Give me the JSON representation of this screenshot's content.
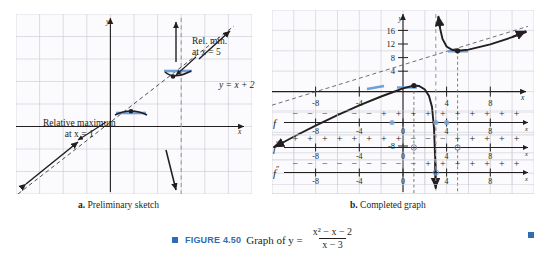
{
  "figure": {
    "label": "FIGURE 4.50",
    "text_before": "Graph of y =",
    "numerator": "x² − x − 2",
    "denominator": "x − 3",
    "accent_color": "#2e6db4"
  },
  "panel_a": {
    "caption_letter": "a.",
    "caption_text": "Preliminary sketch",
    "axis_x_label": "x",
    "axis_y_label": "y",
    "annotations": [
      {
        "name": "relative-maximum",
        "line1": "Relative maximum",
        "line2": "at x = 1"
      },
      {
        "name": "relative-minimum",
        "line1": "Rel. min.",
        "line2": "at x = 5"
      },
      {
        "name": "slant-asymptote",
        "text": "y = x + 2"
      }
    ]
  },
  "panel_b": {
    "caption_letter": "b.",
    "caption_text": "Completed graph",
    "axis_x_label": "x",
    "axis_y_label": "y",
    "x_ticks": [
      "-8",
      "-4",
      "4",
      "8"
    ],
    "y_ticks": [
      "16",
      "12",
      "8",
      "4",
      "-8"
    ]
  },
  "sign_lines": [
    {
      "name": "sign-line-f",
      "label": "f",
      "prime": "",
      "ticks": [
        "-8",
        "-4",
        "0",
        "4",
        "8"
      ],
      "signs": [
        "−",
        "−",
        "−",
        "−",
        "−",
        "−",
        "+",
        "+",
        "+",
        "+",
        "+",
        "+",
        "+",
        "+",
        "+",
        "+"
      ]
    },
    {
      "name": "sign-line-f-prime",
      "label": "f",
      "prime": "′",
      "ticks": [
        "-8",
        "-4",
        "0",
        "4",
        "8"
      ],
      "signs": [
        "+",
        "+",
        "+",
        "+",
        "+",
        "+",
        "+",
        "+",
        "−",
        "−",
        "−",
        "+",
        "+",
        "+",
        "+",
        "+"
      ]
    },
    {
      "name": "sign-line-f-double-prime",
      "label": "f",
      "prime": "″",
      "ticks": [
        "-8",
        "-4",
        "0",
        "4",
        "8"
      ],
      "signs": [
        "−",
        "−",
        "−",
        "−",
        "−",
        "−",
        "−",
        "−",
        "−",
        "+",
        "+",
        "+",
        "+",
        "+",
        "+",
        "+"
      ]
    }
  ],
  "chart_data": {
    "type": "line",
    "function": "y = (x^2 - x - 2)/(x - 3)",
    "xlabel": "x",
    "ylabel": "y",
    "xlim": [
      -12,
      12
    ],
    "ylim": [
      -12,
      18
    ],
    "grid": true,
    "vertical_asymptote": 3,
    "slant_asymptote": "y = x + 2",
    "x_ticks": [
      -8,
      -4,
      4,
      8
    ],
    "y_ticks": [
      16,
      12,
      8,
      4,
      -8
    ],
    "critical_points": [
      {
        "name": "relative maximum",
        "x": 1,
        "y": 1
      },
      {
        "name": "relative minimum",
        "x": 5,
        "y": 9
      }
    ],
    "series": [
      {
        "name": "left branch (x < 3)",
        "x": [
          -11,
          -9,
          -7,
          -5,
          -3,
          -1,
          0,
          1,
          2,
          2.5,
          2.8,
          2.95
        ],
        "y": [
          -9.17,
          -7.33,
          -5.5,
          -3.75,
          -2.0,
          -0.5,
          0.667,
          1.0,
          0.0,
          -2.75,
          -8.8,
          -39.2
        ]
      },
      {
        "name": "right branch (x > 3)",
        "x": [
          3.05,
          3.2,
          3.5,
          4,
          5,
          6,
          7,
          9,
          11
        ],
        "y": [
          41.2,
          12.4,
          11.5,
          10.0,
          9.0,
          9.33,
          10.0,
          11.5,
          13.3
        ]
      }
    ]
  }
}
